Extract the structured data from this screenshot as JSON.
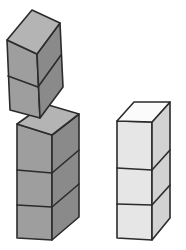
{
  "scene": {
    "title": "Isometric cube stacks illustration",
    "background_color": "#ffffff",
    "width": 186,
    "height": 250,
    "outline_color": "#2b2b2b"
  },
  "palette": {
    "dark_top": "#b4b4b4",
    "dark_front": "#9e9e9e",
    "dark_side": "#8a8a8a",
    "light_top": "#fbfbfb",
    "light_front": "#e6e6e6",
    "light_side": "#d2d2d2"
  },
  "objects": [
    {
      "id": "tilted-block",
      "label": "Tilted falling block",
      "cube_count": 2,
      "shade": "dark",
      "tilt_degrees": -22,
      "position": "top-left"
    },
    {
      "id": "left-stack",
      "label": "Left stack",
      "cube_count": 3,
      "shade": "dark",
      "tilt_degrees": 0,
      "position": "bottom-left"
    },
    {
      "id": "right-stack",
      "label": "Right stack",
      "cube_count": 3,
      "shade": "light",
      "tilt_degrees": 0,
      "position": "bottom-right"
    }
  ],
  "geometry": {
    "tilted_block": {
      "top_face": "7,40 32,10 60,23 37,54",
      "front_face": "7,40 37,54 40,118 10,110",
      "side_face": "37,54 60,23 63,87 40,118",
      "front_divider": "8,76 38,87",
      "side_divider": "38,87 61,55"
    },
    "left_stack": {
      "top_face": "17,124 45,104 79,114 52,135",
      "front_face": "17,124 52,135 52,240 17,238",
      "side_face": "52,135 79,114 79,217 52,240",
      "front_dividers": [
        "17,170 52,173",
        "17,205 52,207"
      ],
      "side_dividers": [
        "52,173 79,150",
        "52,207 79,184"
      ]
    },
    "right_stack": {
      "top_face": "117,121 134,102 170,102 152,122",
      "front_face": "117,121 152,122 152,240 117,238",
      "side_face": "152,122 170,102 170,218 152,240",
      "front_dividers": [
        "117,168 152,170",
        "117,204 152,205"
      ],
      "side_dividers": [
        "152,170 170,150",
        "152,205 170,185"
      ]
    }
  }
}
